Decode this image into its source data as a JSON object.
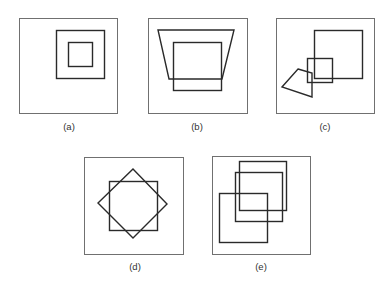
{
  "figure": {
    "colors": {
      "frame": "#707070",
      "shape": "#2a2a2a",
      "label": "#333333"
    },
    "panels": [
      {
        "id": "a",
        "label": "(a)",
        "frame": [
          19,
          18,
          98,
          95
        ],
        "shapes": [
          {
            "type": "rect",
            "coords": [
              56,
              30,
              48,
              48
            ]
          },
          {
            "type": "rect",
            "coords": [
              68,
              42,
              24,
              24
            ]
          }
        ]
      },
      {
        "id": "b",
        "label": "(b)",
        "frame": [
          148,
          18,
          99,
          95
        ],
        "shapes": [
          {
            "type": "polygon",
            "points": "158,30 234,30 222,79 169,79"
          },
          {
            "type": "rect",
            "coords": [
              173,
              42,
              48,
              48
            ]
          }
        ]
      },
      {
        "id": "c",
        "label": "(c)",
        "frame": [
          276,
          18,
          98,
          95
        ],
        "shapes": [
          {
            "type": "rect",
            "coords": [
              314,
              30,
              48,
              48
            ]
          },
          {
            "type": "rect",
            "coords": [
              307,
              58,
              25,
              24
            ]
          },
          {
            "type": "polygon",
            "points": "298,69 312,73 312,97 282,87"
          }
        ]
      },
      {
        "id": "d",
        "label": "(d)",
        "frame": [
          84,
          157,
          99,
          97
        ],
        "shapes": [
          {
            "type": "rect",
            "coords": [
              109,
              181,
              48,
              49
            ]
          },
          {
            "type": "polygon",
            "points": "133,169 167,204 133,238 98,203"
          }
        ]
      },
      {
        "id": "e",
        "label": "(e)",
        "frame": [
          212,
          156,
          98,
          98
        ],
        "shapes": [
          {
            "type": "rect",
            "coords": [
              239,
              161,
              47,
              49
            ]
          },
          {
            "type": "rect",
            "coords": [
              235,
              172,
              47,
              49
            ]
          },
          {
            "type": "rect",
            "coords": [
              219,
              193,
              48,
              49
            ]
          }
        ]
      }
    ],
    "labels": [
      {
        "text": "(a)",
        "x": 69,
        "y": 130
      },
      {
        "text": "(b)",
        "x": 197,
        "y": 130
      },
      {
        "text": "(c)",
        "x": 325,
        "y": 130
      },
      {
        "text": "(d)",
        "x": 135,
        "y": 270
      },
      {
        "text": "(e)",
        "x": 261,
        "y": 270
      }
    ]
  }
}
